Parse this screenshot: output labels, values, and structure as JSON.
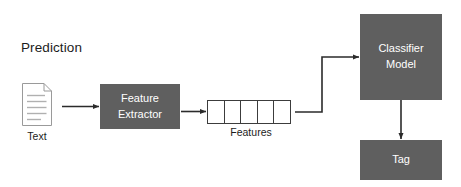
{
  "diagram": {
    "title": "Prediction",
    "background_color": "#ffffff",
    "box_fill_color": "#5f5f5f",
    "box_text_color": "#ffffff",
    "connector_color": "#2b2b2b",
    "text_color": "#1c1c1c"
  },
  "nodes": {
    "text_input": {
      "icon": "document-icon",
      "label": "Text",
      "line_count": 5
    },
    "feature_extractor": {
      "label_line1": "Feature",
      "label_line2": "Extractor"
    },
    "features": {
      "label": "Features",
      "cell_count": 5,
      "cells": [
        "",
        "",
        "",
        "",
        ""
      ]
    },
    "classifier": {
      "label_line1": "Classifier",
      "label_line2": "Model"
    },
    "tag_output": {
      "label": "Tag"
    }
  },
  "connectors": [
    {
      "name": "text-to-feature-extractor",
      "type": "straight-arrow",
      "direction": "right"
    },
    {
      "name": "feature-extractor-to-features",
      "type": "straight-arrow",
      "direction": "right"
    },
    {
      "name": "features-to-classifier",
      "type": "elbow-arrow",
      "direction": "right-up-right"
    },
    {
      "name": "classifier-to-tag",
      "type": "straight-arrow",
      "direction": "down"
    }
  ]
}
